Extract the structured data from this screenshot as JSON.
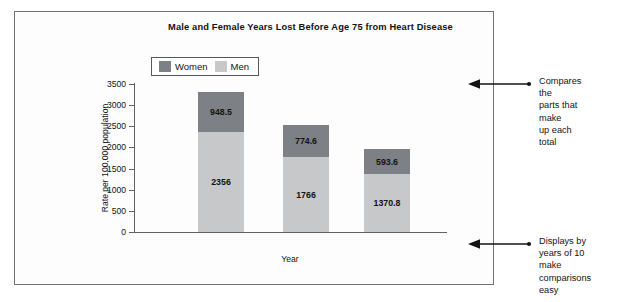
{
  "figure": {
    "frame_border_color": "#6f7276",
    "background": "#ffffff"
  },
  "chart_data": {
    "type": "bar",
    "stacked": true,
    "title": "Male and Female Years Lost Before Age 75 from Heart Disease",
    "xlabel": "Year",
    "ylabel": "Rate per 100,000 population",
    "categories": [
      "1990",
      "2000",
      "2010"
    ],
    "series": [
      {
        "name": "Men",
        "color": "#c6c8ca",
        "values": [
          2356,
          1766,
          1370.8
        ],
        "labels": [
          "2356",
          "1766",
          "1370.8"
        ]
      },
      {
        "name": "Women",
        "color": "#7d8084",
        "values": [
          948.5,
          774.6,
          593.6
        ],
        "labels": [
          "948.5",
          "774.6",
          "593.6"
        ]
      }
    ],
    "stack_order_bottom_to_top": [
      "Men",
      "Women"
    ],
    "totals": [
      3304.5,
      2540.6,
      1964.4
    ],
    "ylim": [
      0,
      3500
    ],
    "ytick_values": [
      0,
      500,
      1000,
      1500,
      2000,
      2500,
      3000,
      3500
    ],
    "ytick_labels": [
      "0",
      "500",
      "1000",
      "1500",
      "2000",
      "2500",
      "3000",
      "3500"
    ],
    "grid": false,
    "legend_position": "top-left-inside",
    "legend_entries": [
      "Women",
      "Men"
    ]
  },
  "annotations": [
    {
      "id": "compares-parts",
      "text": "Compares the\nparts that make\nup each total",
      "arrow": "left-arrow-with-dot"
    },
    {
      "id": "decade-comparison",
      "text": "Displays by\nyears of 10 make\ncomparisons easy",
      "arrow": "left-arrow-with-dot"
    }
  ]
}
